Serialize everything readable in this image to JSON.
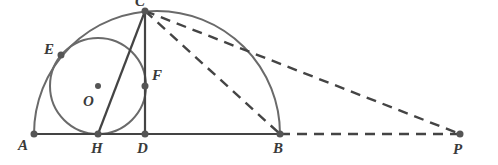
{
  "diagram": {
    "colors": {
      "stroke": "#444444",
      "arc": "#6a6a6a",
      "point": "#555555"
    },
    "points": {
      "A": {
        "label": "A",
        "x": 34,
        "y": 134
      },
      "H": {
        "label": "H",
        "x": 98,
        "y": 134
      },
      "D": {
        "label": "D",
        "x": 145,
        "y": 134
      },
      "B": {
        "label": "B",
        "x": 280,
        "y": 134
      },
      "P": {
        "label": "P",
        "x": 460,
        "y": 134
      },
      "C": {
        "label": "C",
        "x": 145,
        "y": 11
      },
      "E": {
        "label": "E",
        "x": 61,
        "y": 55
      },
      "F": {
        "label": "F",
        "x": 145,
        "y": 86
      },
      "O": {
        "label": "O",
        "x": 98,
        "y": 86
      }
    },
    "shapes": [
      "semicircle on diameter AB",
      "circle O tangent to AB at H, to CD at F, and to arc at E",
      "segment CD perpendicular to AB",
      "segment CH",
      "dashed segments CB, CP, BP"
    ]
  }
}
